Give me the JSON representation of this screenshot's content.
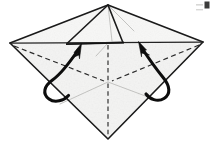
{
  "figure": {
    "background_color": "#ffffff",
    "paper_color": "#f7f7f6",
    "line_color": "#1a1a1a",
    "crease_color": "#2a2a2a",
    "arrow_color": "#0d0d0d",
    "faint_crease_color": "#b9b9b7"
  },
  "geometry": {
    "outer_diamond": {
      "name": "outer-paper-diamond",
      "vertices": [
        {
          "name": "left-vertex",
          "x": 10,
          "y": 43
        },
        {
          "name": "top-vertex",
          "x": 108,
          "y": 5
        },
        {
          "name": "right-vertex",
          "x": 203,
          "y": 42
        },
        {
          "name": "bottom-vertex",
          "x": 108,
          "y": 139
        }
      ]
    },
    "inner_flap_triangle": {
      "name": "inner-triangle-flap",
      "vertices": [
        {
          "name": "flap-apex",
          "x": 108,
          "y": 5
        },
        {
          "name": "flap-left-corner",
          "x": 67,
          "y": 43
        },
        {
          "name": "flap-right-corner",
          "x": 122,
          "y": 41
        }
      ]
    },
    "center_point": {
      "name": "center-crease-junction",
      "x": 108,
      "y": 82
    },
    "horizontal_fold_line": {
      "name": "horizontal-fold-line",
      "from": {
        "x": 10,
        "y": 43
      },
      "to": {
        "x": 203,
        "y": 42
      }
    },
    "sliver_overlap": {
      "name": "flap-edge-sliver",
      "from": {
        "x": 66,
        "y": 44
      },
      "to": {
        "x": 124,
        "y": 42
      }
    }
  },
  "creases": [
    {
      "name": "crease-left-diagonal",
      "style": "dashed",
      "from": {
        "x": 13,
        "y": 45
      },
      "to": {
        "x": 108,
        "y": 82
      }
    },
    {
      "name": "crease-right-diagonal",
      "style": "dashed",
      "from": {
        "x": 200,
        "y": 44
      },
      "to": {
        "x": 108,
        "y": 82
      }
    },
    {
      "name": "crease-vertical-center",
      "style": "dashed",
      "from": {
        "x": 108,
        "y": 42
      },
      "to": {
        "x": 108,
        "y": 137
      }
    },
    {
      "name": "crease-faint-lower-left",
      "style": "faint",
      "from": {
        "x": 108,
        "y": 82
      },
      "to": {
        "x": 60,
        "y": 104
      }
    },
    {
      "name": "crease-faint-lower-right",
      "style": "faint",
      "from": {
        "x": 108,
        "y": 82
      },
      "to": {
        "x": 156,
        "y": 100
      }
    },
    {
      "name": "crease-faint-flap-center",
      "style": "faint",
      "from": {
        "x": 108,
        "y": 5
      },
      "to": {
        "x": 112,
        "y": 41
      }
    },
    {
      "name": "crease-faint-flap-right",
      "style": "faint",
      "from": {
        "x": 108,
        "y": 5
      },
      "to": {
        "x": 134,
        "y": 31
      }
    }
  ],
  "arrows": [
    {
      "name": "left-fold-arrow",
      "label": "fold left flap up and inward",
      "direction": "up-right",
      "tip": {
        "x": 80,
        "y": 46
      },
      "tail": {
        "x": 63,
        "y": 97
      }
    },
    {
      "name": "right-fold-arrow",
      "label": "fold right flap up and inward",
      "direction": "up-left",
      "tip": {
        "x": 140,
        "y": 43
      },
      "tail": {
        "x": 158,
        "y": 96
      }
    }
  ],
  "marks": [
    {
      "name": "top-right-corner-mark",
      "x": 204,
      "y": 2,
      "width": 5,
      "height": 7
    }
  ]
}
